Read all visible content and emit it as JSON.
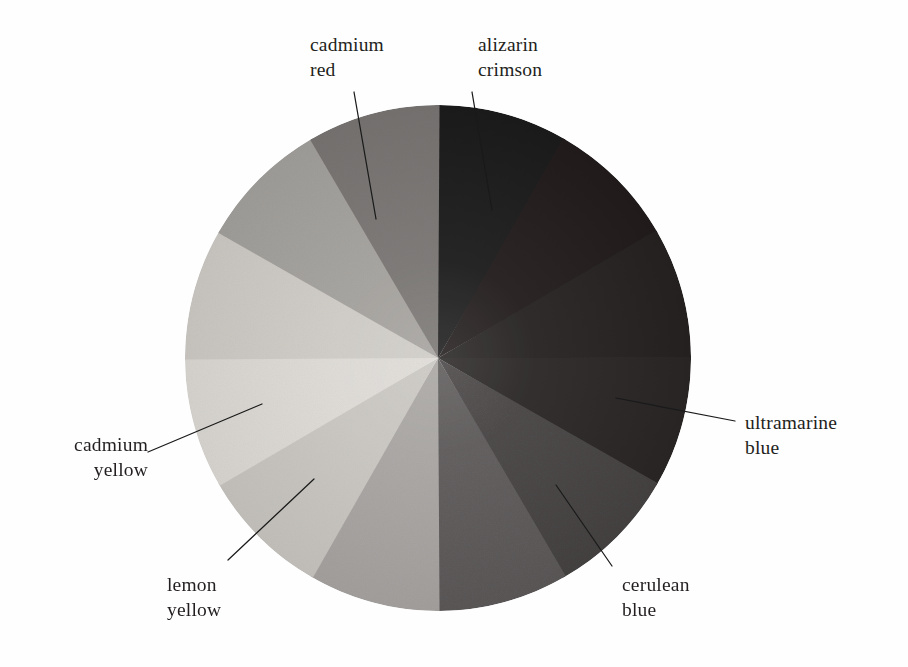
{
  "figure": {
    "type": "color-wheel-diagram",
    "background_color": "#fefefe",
    "center": {
      "x": 438,
      "y": 358
    },
    "radius": 253,
    "segment_count": 12,
    "segment_arc_degrees": 30,
    "note_rendering": "grayscale reproduction of a painted pigment color wheel"
  },
  "labels": [
    {
      "id": "cadmium-red",
      "line1": "cadmium",
      "line2": "red",
      "align": "left",
      "x": 310,
      "y": 32,
      "leader": {
        "x1": 354,
        "y1": 92,
        "x2": 376,
        "y2": 219
      }
    },
    {
      "id": "alizarin-crimson",
      "line1": "alizarin",
      "line2": "crimson",
      "align": "left",
      "x": 478,
      "y": 32,
      "leader": {
        "x1": 472,
        "y1": 92,
        "x2": 492,
        "y2": 210
      }
    },
    {
      "id": "ultramarine-blue",
      "line1": "ultramarine",
      "line2": "blue",
      "align": "left",
      "x": 745,
      "y": 410,
      "leader": {
        "x1": 735,
        "y1": 421,
        "x2": 616,
        "y2": 398
      }
    },
    {
      "id": "cerulean-blue",
      "line1": "cerulean",
      "line2": "blue",
      "align": "left",
      "x": 622,
      "y": 572,
      "leader": {
        "x1": 612,
        "y1": 566,
        "x2": 556,
        "y2": 485
      }
    },
    {
      "id": "lemon-yellow",
      "line1": "lemon",
      "line2": "yellow",
      "align": "left",
      "x": 167,
      "y": 572,
      "leader": {
        "x1": 228,
        "y1": 560,
        "x2": 314,
        "y2": 479
      }
    },
    {
      "id": "cadmium-yellow",
      "line1": "cadmium",
      "line2": "yellow",
      "align": "right",
      "x": 16,
      "y": 432,
      "leader": {
        "x1": 148,
        "y1": 452,
        "x2": 262,
        "y2": 404
      }
    }
  ],
  "chart_data": {
    "type": "pie",
    "title": "",
    "subtitle": "",
    "xlabel": "",
    "ylabel": "",
    "legend_position": "callout-labels",
    "grid": false,
    "total_segments": 12,
    "each_segment_value": 1,
    "each_segment_degrees": 30,
    "start_angle_degrees": 0,
    "start_angle_note": "first segment begins at 12 o'clock and proceeds clockwise",
    "categories": [
      "alizarin crimson",
      "segment-2",
      "segment-3",
      "ultramarine blue",
      "segment-5",
      "cerulean blue",
      "segment-7",
      "segment-8",
      "lemon yellow",
      "cadmium yellow",
      "segment-11",
      "cadmium red"
    ],
    "values": [
      1,
      1,
      1,
      1,
      1,
      1,
      1,
      1,
      1,
      1,
      1,
      1
    ],
    "segments": [
      {
        "index": 0,
        "start_deg": 0,
        "end_deg": 30,
        "label": "alizarin crimson",
        "labeled": true,
        "gray": "#1e1b1b"
      },
      {
        "index": 1,
        "start_deg": 30,
        "end_deg": 60,
        "label": "",
        "labeled": false,
        "gray": "#221f1f"
      },
      {
        "index": 2,
        "start_deg": 60,
        "end_deg": 90,
        "label": "",
        "labeled": false,
        "gray": "#262222"
      },
      {
        "index": 3,
        "start_deg": 90,
        "end_deg": 120,
        "label": "ultramarine blue",
        "labeled": true,
        "gray": "#2a2626"
      },
      {
        "index": 4,
        "start_deg": 120,
        "end_deg": 150,
        "label": "",
        "labeled": false,
        "gray": "#474444"
      },
      {
        "index": 5,
        "start_deg": 150,
        "end_deg": 180,
        "label": "cerulean blue",
        "labeled": true,
        "gray": "#5d5a5a"
      },
      {
        "index": 6,
        "start_deg": 180,
        "end_deg": 210,
        "label": "",
        "labeled": false,
        "gray": "#a9a6a3"
      },
      {
        "index": 7,
        "start_deg": 210,
        "end_deg": 240,
        "label": "",
        "labeled": false,
        "gray": "#cac7c2"
      },
      {
        "index": 8,
        "start_deg": 240,
        "end_deg": 270,
        "label": "lemon yellow",
        "labeled": true,
        "gray": "#dedbd6"
      },
      {
        "index": 9,
        "start_deg": 270,
        "end_deg": 300,
        "label": "cadmium yellow",
        "labeled": true,
        "gray": "#cfccc7"
      },
      {
        "index": 10,
        "start_deg": 300,
        "end_deg": 330,
        "label": "",
        "labeled": false,
        "gray": "#a5a29e"
      },
      {
        "index": 11,
        "start_deg": 330,
        "end_deg": 360,
        "label": "cadmium red",
        "labeled": true,
        "gray": "#7a7674"
      }
    ]
  }
}
